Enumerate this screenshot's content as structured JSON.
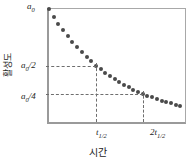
{
  "figure": {
    "background_color": "#ffffff",
    "axis_color": "#9a9a9a",
    "dot_color": "#4a4a4a",
    "dash_color": "#6e6e6e"
  },
  "axes": {
    "ylabel": "활성도",
    "xlabel": "시간",
    "y_ticks": [
      {
        "id": "a0",
        "base": "a",
        "sub": "0",
        "frac": ""
      },
      {
        "id": "a0_half",
        "base": "a",
        "sub": "0",
        "frac": "/2"
      },
      {
        "id": "a0_quarter",
        "base": "a",
        "sub": "0",
        "frac": "/4"
      }
    ],
    "x_ticks": [
      {
        "id": "t_half",
        "prefix": "",
        "base": "t",
        "sub": "1/2"
      },
      {
        "id": "two_t_half",
        "prefix": "2",
        "base": "t",
        "sub": "1/2"
      }
    ]
  },
  "labels": {
    "a0_base": "a",
    "a0_sub": "0",
    "a0_half_base": "a",
    "a0_half_sub": "0",
    "a0_half_frac": "/2",
    "a0_quarter_base": "a",
    "a0_quarter_sub": "0",
    "a0_quarter_frac": "/4",
    "t_half_prefix": "",
    "t_half_base": "t",
    "t_half_sub": "1/2",
    "two_t_half_prefix": "2",
    "two_t_half_base": "t",
    "two_t_half_sub": "1/2"
  },
  "chart_data": {
    "type": "scatter",
    "title": "",
    "subtitle": "",
    "xlabel": "시간",
    "ylabel": "활성도",
    "grid": false,
    "legend": null,
    "xlim": [
      0,
      2.9
    ],
    "ylim": [
      0,
      1.0
    ],
    "x_tick_values": [
      1,
      2
    ],
    "x_tick_labels": [
      "t1/2",
      "2t1/2"
    ],
    "y_tick_values": [
      1.0,
      0.5,
      0.25
    ],
    "y_tick_labels": [
      "a0",
      "a0/2",
      "a0/4"
    ],
    "series": [
      {
        "name": "activity decay",
        "marker": "circle",
        "color": "#4a4a4a",
        "x": [
          0.0,
          0.1,
          0.2,
          0.3,
          0.4,
          0.5,
          0.6,
          0.7,
          0.8,
          0.9,
          1.0,
          1.1,
          1.2,
          1.3,
          1.4,
          1.5,
          1.6,
          1.7,
          1.8,
          1.9,
          2.0,
          2.1,
          2.2,
          2.3,
          2.4,
          2.5,
          2.6,
          2.7,
          2.8
        ],
        "y": [
          1.0,
          0.933,
          0.871,
          0.812,
          0.758,
          0.707,
          0.66,
          0.616,
          0.574,
          0.536,
          0.5,
          0.467,
          0.435,
          0.406,
          0.379,
          0.354,
          0.33,
          0.308,
          0.287,
          0.268,
          0.25,
          0.233,
          0.218,
          0.203,
          0.189,
          0.177,
          0.165,
          0.154,
          0.144
        ]
      }
    ],
    "annotations": [
      {
        "type": "hline",
        "y": 0.5,
        "x_from": 0.0,
        "x_to": 1.0,
        "style": "dashed",
        "label": "a0/2"
      },
      {
        "type": "hline",
        "y": 0.25,
        "x_from": 0.0,
        "x_to": 2.0,
        "style": "dashed",
        "label": "a0/4"
      },
      {
        "type": "vline",
        "x": 1.0,
        "y_from": 0.0,
        "y_to": 0.5,
        "style": "dashed",
        "label": "t1/2"
      },
      {
        "type": "vline",
        "x": 2.0,
        "y_from": 0.0,
        "y_to": 0.25,
        "style": "dashed",
        "label": "2t1/2"
      }
    ]
  }
}
